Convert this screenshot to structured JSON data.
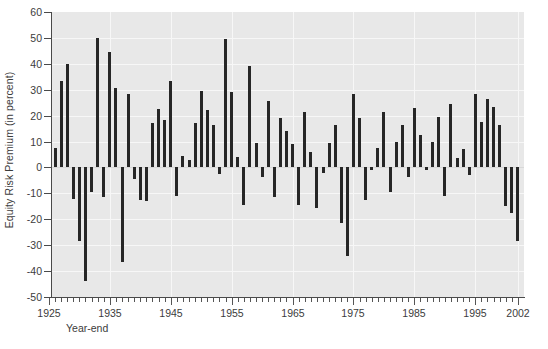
{
  "chart_data": {
    "type": "bar",
    "title": "",
    "xlabel": "Year-end",
    "ylabel": "Equity Risk Premium (in percent)",
    "ylim": [
      -50,
      60
    ],
    "xlim": [
      1925.5,
      2003.0
    ],
    "yticks": [
      60,
      50,
      40,
      30,
      20,
      10,
      0,
      -10,
      -20,
      -30,
      -40,
      -50
    ],
    "xticks": [
      1925,
      1935,
      1945,
      1955,
      1965,
      1975,
      1985,
      1995,
      2002
    ],
    "xtick_labels": [
      "1925",
      "1935",
      "1945",
      "1955",
      "1965",
      "1975",
      "1985",
      "1995",
      "2002"
    ],
    "grid": true,
    "legend": null,
    "bar_color": "#262626",
    "plot_background": "#e8e8e8",
    "gridline_color": "#f7f7f7",
    "categories": [
      1926,
      1927,
      1928,
      1929,
      1930,
      1931,
      1932,
      1933,
      1934,
      1935,
      1936,
      1937,
      1938,
      1939,
      1940,
      1941,
      1942,
      1943,
      1944,
      1945,
      1946,
      1947,
      1948,
      1949,
      1950,
      1951,
      1952,
      1953,
      1954,
      1955,
      1956,
      1957,
      1958,
      1959,
      1960,
      1961,
      1962,
      1963,
      1964,
      1965,
      1966,
      1967,
      1968,
      1969,
      1970,
      1971,
      1972,
      1973,
      1974,
      1975,
      1976,
      1977,
      1978,
      1979,
      1980,
      1981,
      1982,
      1983,
      1984,
      1985,
      1986,
      1987,
      1988,
      1989,
      1990,
      1991,
      1992,
      1993,
      1994,
      1995,
      1996,
      1997,
      1998,
      1999,
      2000,
      2001,
      2002
    ],
    "values": [
      7.5,
      33.5,
      40.0,
      -12.0,
      -28.5,
      -44.0,
      -9.5,
      50.0,
      -11.5,
      44.5,
      30.5,
      -36.5,
      28.5,
      -4.5,
      -12.5,
      -13.0,
      17.0,
      22.5,
      18.5,
      33.5,
      -11.0,
      4.5,
      3.0,
      17.0,
      29.5,
      22.0,
      16.5,
      -2.5,
      49.5,
      29.0,
      4.0,
      -14.5,
      39.0,
      9.5,
      -3.5,
      25.5,
      -11.5,
      19.0,
      14.0,
      9.0,
      -14.5,
      21.5,
      6.0,
      -15.5,
      -2.0,
      9.5,
      16.5,
      -21.5,
      -34.0,
      28.5,
      19.0,
      -12.5,
      -1.0,
      7.5,
      21.5,
      -9.5,
      10.0,
      16.5,
      -3.5,
      23.0,
      12.5,
      -1.0,
      10.0,
      19.5,
      -11.0,
      24.5,
      3.5,
      7.0,
      -3.0,
      28.5,
      17.5,
      26.5,
      23.5,
      16.5,
      -15.0,
      -17.5,
      -28.5
    ]
  }
}
